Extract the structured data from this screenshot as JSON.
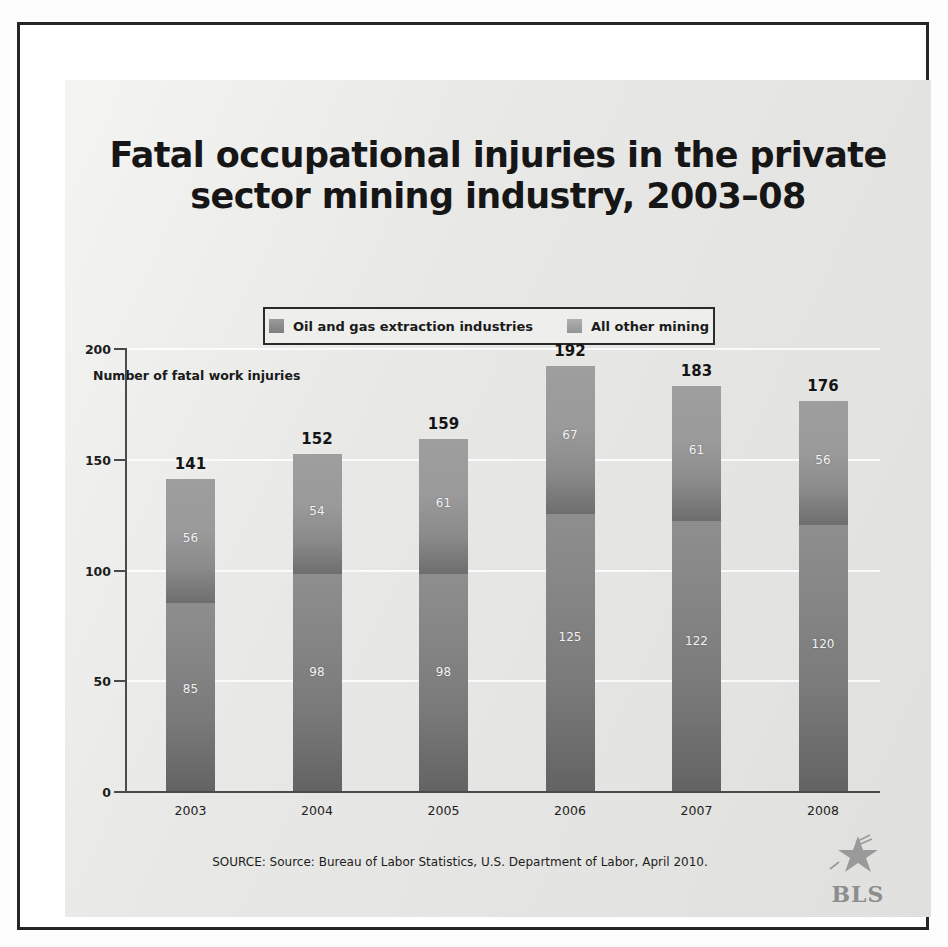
{
  "figure": {
    "title": "Fatal occupational injuries in the private\nsector mining industry, 2003–08",
    "source_note": "SOURCE: Source: Bureau of Labor Statistics, U.S. Department of Labor, April 2010.",
    "logo": {
      "name": "bls-logo",
      "text": "BLS",
      "icon": "star-eagle-icon"
    }
  },
  "legend": {
    "items": [
      {
        "label": "Oil and gas extraction industries",
        "color": "#8a8a8a",
        "swatch_icon": "legend-swatch-icon"
      },
      {
        "label": "All other mining",
        "color": "#a2a2a2",
        "swatch_icon": "legend-swatch-icon"
      }
    ]
  },
  "chart_data": {
    "type": "bar",
    "subtype": "stacked-vertical",
    "title": "Fatal occupational injuries in the private sector mining industry, 2003–08",
    "xlabel": "",
    "ylabel": "Number of fatal work injuries",
    "ylim": [
      0,
      200
    ],
    "yticks": [
      0,
      50,
      100,
      150,
      200
    ],
    "ytick_labels": [
      "0",
      "50",
      "100",
      "150",
      "200"
    ],
    "grid": true,
    "legend_position": "top-center",
    "categories": [
      "2003",
      "2004",
      "2005",
      "2006",
      "2007",
      "2008"
    ],
    "series": [
      {
        "name": "Oil and gas extraction industries",
        "color": "#8a8a8a",
        "values": [
          85,
          98,
          98,
          125,
          122,
          120
        ]
      },
      {
        "name": "All other mining",
        "color": "#a2a2a2",
        "values": [
          56,
          54,
          61,
          67,
          61,
          56
        ]
      }
    ],
    "totals": [
      141,
      152,
      159,
      192,
      183,
      176
    ]
  }
}
